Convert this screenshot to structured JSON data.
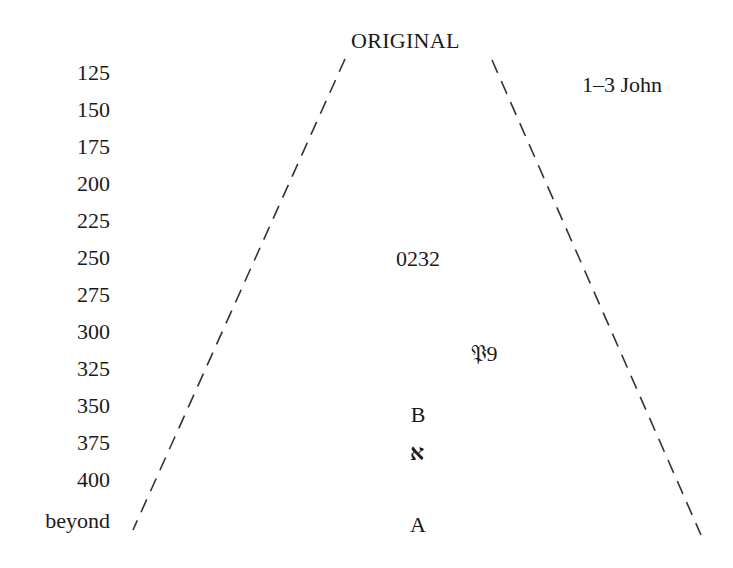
{
  "diagram": {
    "title": "ORIGINAL",
    "book_label": "1–3 John",
    "axis_labels": [
      "125",
      "150",
      "175",
      "200",
      "225",
      "250",
      "275",
      "300",
      "325",
      "350",
      "375",
      "400",
      "beyond"
    ],
    "manuscripts": [
      {
        "label": "0232",
        "date_row": "250"
      },
      {
        "label": "𝔓9",
        "date_row": "325"
      },
      {
        "label": "B",
        "date_row": "350"
      },
      {
        "label": "א",
        "date_row": "375"
      },
      {
        "label": "A",
        "date_row": "beyond"
      }
    ],
    "line_style": "dashed",
    "line_color": "#333333"
  }
}
